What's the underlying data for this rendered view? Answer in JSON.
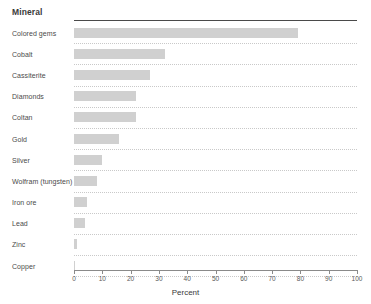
{
  "header": {
    "category_header": "Mineral"
  },
  "chart_data": {
    "type": "bar",
    "orientation": "horizontal",
    "title": "",
    "xlabel": "Percent",
    "ylabel": "Mineral",
    "xlim": [
      0,
      100
    ],
    "grid": true,
    "legend": false,
    "categories": [
      "Colored gems",
      "Cobalt",
      "Cassiterite",
      "Diamonds",
      "Coltan",
      "Gold",
      "Silver",
      "Wolfram (tungsten)",
      "Iron ore",
      "Lead",
      "Zinc",
      "Copper"
    ],
    "values": [
      79,
      32,
      27,
      22,
      22,
      16,
      10,
      8,
      4.5,
      4,
      1,
      0.3
    ],
    "xticks": [
      0,
      10,
      20,
      30,
      40,
      50,
      60,
      70,
      80,
      90,
      100
    ],
    "xtick_labels": [
      "0",
      "10",
      "20",
      "30",
      "40",
      "50",
      "60",
      "70",
      "80",
      "90",
      "100"
    ],
    "bar_color": "#d0d0d0",
    "gridline_color": "#c9c9c9",
    "axis_color": "#8a8a8a"
  }
}
